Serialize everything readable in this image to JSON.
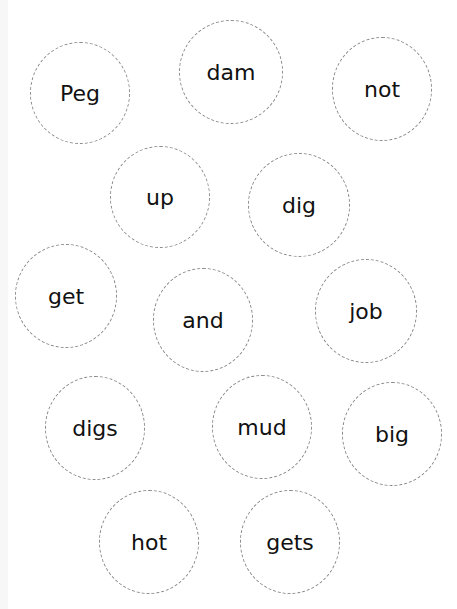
{
  "page": {
    "heading_partial": "",
    "dash_color": "#8a8a8a",
    "text_color": "#111111"
  },
  "words": [
    {
      "label": "Peg",
      "cx": 80,
      "cy": 93
    },
    {
      "label": "dam",
      "cx": 230,
      "cy": 72
    },
    {
      "label": "not",
      "cx": 382,
      "cy": 89
    },
    {
      "label": "up",
      "cx": 160,
      "cy": 198
    },
    {
      "label": "dig",
      "cx": 299,
      "cy": 205
    },
    {
      "label": "get",
      "cx": 66,
      "cy": 296
    },
    {
      "label": "and",
      "cx": 203,
      "cy": 320
    },
    {
      "label": "job",
      "cx": 366,
      "cy": 311
    },
    {
      "label": "digs",
      "cx": 95,
      "cy": 428
    },
    {
      "label": "mud",
      "cx": 262,
      "cy": 427
    },
    {
      "label": "big",
      "cx": 392,
      "cy": 434
    },
    {
      "label": "hot",
      "cx": 149,
      "cy": 542
    },
    {
      "label": "gets",
      "cx": 290,
      "cy": 542
    }
  ]
}
